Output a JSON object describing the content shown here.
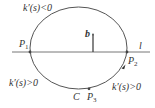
{
  "figure": {
    "colors": {
      "stroke": "#555555",
      "text": "#333333",
      "background": "#ffffff"
    },
    "curve": {
      "name": "C",
      "label": "C"
    },
    "line": {
      "name": "l",
      "label": "l"
    },
    "vector": {
      "name": "b",
      "label": "b"
    },
    "points": [
      {
        "name": "P1",
        "label": "P",
        "sub": "1"
      },
      {
        "name": "P2",
        "label": "P",
        "sub": "2"
      },
      {
        "name": "P3",
        "label": "P",
        "sub": "3"
      }
    ],
    "annotations": {
      "top": "k′(s)<0",
      "bottom_left": "k′(s)>0",
      "bottom_right": "k′(s)>0"
    }
  }
}
